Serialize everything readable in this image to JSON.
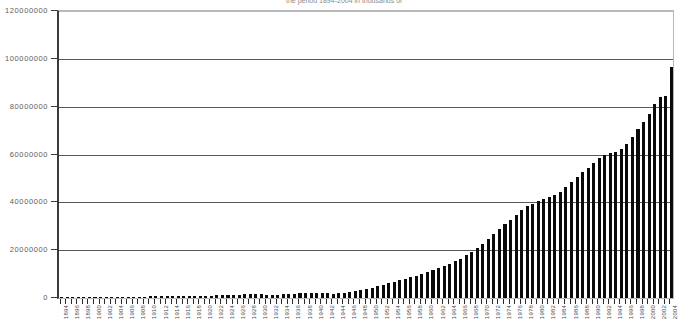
{
  "chart_data": {
    "type": "bar",
    "title": "the period 1894-2004 in thousands of",
    "xlabel": "",
    "ylabel": "",
    "ylim": [
      0,
      120000000
    ],
    "ytick_labels": [
      "0",
      "20000000",
      "40000000",
      "60000000",
      "80000000",
      "100000000",
      "120000000"
    ],
    "ytick_values": [
      0,
      20000000,
      40000000,
      60000000,
      80000000,
      100000000,
      120000000
    ],
    "grid": true,
    "legend": "none",
    "bar_color": "#0a0a0a",
    "xtick_label_step": 2,
    "categories": [
      "1894",
      "1895",
      "1896",
      "1897",
      "1898",
      "1899",
      "1900",
      "1901",
      "1902",
      "1903",
      "1904",
      "1905",
      "1906",
      "1907",
      "1908",
      "1909",
      "1910",
      "1911",
      "1912",
      "1913",
      "1914",
      "1915",
      "1916",
      "1917",
      "1918",
      "1919",
      "1920",
      "1921",
      "1922",
      "1923",
      "1924",
      "1925",
      "1926",
      "1927",
      "1928",
      "1929",
      "1930",
      "1931",
      "1932",
      "1933",
      "1934",
      "1935",
      "1936",
      "1937",
      "1938",
      "1939",
      "1940",
      "1941",
      "1942",
      "1943",
      "1944",
      "1945",
      "1946",
      "1947",
      "1948",
      "1949",
      "1950",
      "1951",
      "1952",
      "1953",
      "1954",
      "1955",
      "1956",
      "1957",
      "1958",
      "1959",
      "1960",
      "1961",
      "1962",
      "1963",
      "1964",
      "1965",
      "1966",
      "1967",
      "1968",
      "1969",
      "1970",
      "1971",
      "1972",
      "1973",
      "1974",
      "1975",
      "1976",
      "1977",
      "1978",
      "1979",
      "1980",
      "1981",
      "1982",
      "1983",
      "1984",
      "1985",
      "1986",
      "1987",
      "1988",
      "1989",
      "1990",
      "1991",
      "1992",
      "1993",
      "1994",
      "1995",
      "1996",
      "1997",
      "1998",
      "1999",
      "2000",
      "2001",
      "2002",
      "2003",
      "2004"
    ],
    "values": [
      120000,
      140000,
      160000,
      180000,
      200000,
      230000,
      260000,
      290000,
      320000,
      360000,
      400000,
      440000,
      480000,
      520000,
      560000,
      600000,
      650000,
      700000,
      750000,
      800000,
      820000,
      780000,
      760000,
      740000,
      720000,
      800000,
      900000,
      1000000,
      1100000,
      1200000,
      1300000,
      1400000,
      1450000,
      1500000,
      1550000,
      1600000,
      1550000,
      1450000,
      1400000,
      1450000,
      1550000,
      1700000,
      1850000,
      2000000,
      2100000,
      2150000,
      2100000,
      2000000,
      1900000,
      1850000,
      1900000,
      2100000,
      2600000,
      3100000,
      3500000,
      3900000,
      4300000,
      4900000,
      5500000,
      6100000,
      6700000,
      7400000,
      8100000,
      8800000,
      9300000,
      10000000,
      10800000,
      11600000,
      12400000,
      13300000,
      14300000,
      15300000,
      16500000,
      17800000,
      19200000,
      20800000,
      22600000,
      24600000,
      26600000,
      28700000,
      30800000,
      32700000,
      34800000,
      36800000,
      38500000,
      39500000,
      40500000,
      41500000,
      42200000,
      43000000,
      44500000,
      46500000,
      48500000,
      50500000,
      52500000,
      54500000,
      56500000,
      58500000,
      60000000,
      60500000,
      61000000,
      62500000,
      64500000,
      67500000,
      70500000,
      73500000,
      77000000,
      81000000,
      84000000,
      84500000,
      96500000
    ]
  }
}
